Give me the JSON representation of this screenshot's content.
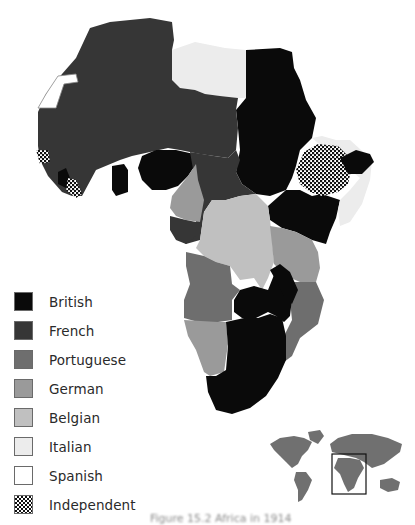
{
  "map": {
    "title": "Colonial Africa",
    "colors": {
      "British": "#0a0a0a",
      "French": "#363636",
      "Portuguese": "#6e6e6e",
      "German": "#9a9a9a",
      "Belgian": "#c0c0c0",
      "Italian": "#ececec",
      "Spanish": "#ffffff",
      "Independent": "pattern-checker"
    },
    "regions": [
      {
        "name": "French West & North Africa",
        "power": "French"
      },
      {
        "name": "Spanish Sahara",
        "power": "Spanish"
      },
      {
        "name": "Libya",
        "power": "Italian"
      },
      {
        "name": "Egypt & Sudan",
        "power": "British"
      },
      {
        "name": "Ethiopia",
        "power": "Independent"
      },
      {
        "name": "Liberia",
        "power": "Independent"
      },
      {
        "name": "Somaliland",
        "power": "British"
      },
      {
        "name": "Italian Somaliland",
        "power": "Italian"
      },
      {
        "name": "Nigeria",
        "power": "British"
      },
      {
        "name": "Gold Coast",
        "power": "British"
      },
      {
        "name": "Sierra Leone",
        "power": "British"
      },
      {
        "name": "Kamerun",
        "power": "German"
      },
      {
        "name": "French Equatorial Africa",
        "power": "French"
      },
      {
        "name": "Belgian Congo",
        "power": "Belgian"
      },
      {
        "name": "Kenya & Uganda",
        "power": "British"
      },
      {
        "name": "German East Africa",
        "power": "German"
      },
      {
        "name": "Angola",
        "power": "Portuguese"
      },
      {
        "name": "Mozambique",
        "power": "Portuguese"
      },
      {
        "name": "Rhodesia",
        "power": "British"
      },
      {
        "name": "German South West Africa",
        "power": "German"
      },
      {
        "name": "South Africa",
        "power": "British"
      }
    ]
  },
  "legend": {
    "items": [
      {
        "label": "British",
        "color": "#0a0a0a"
      },
      {
        "label": "French",
        "color": "#363636"
      },
      {
        "label": "Portuguese",
        "color": "#6e6e6e"
      },
      {
        "label": "German",
        "color": "#9a9a9a"
      },
      {
        "label": "Belgian",
        "color": "#c0c0c0"
      },
      {
        "label": "Italian",
        "color": "#ececec"
      },
      {
        "label": "Spanish",
        "color": "#ffffff"
      },
      {
        "label": "Independent",
        "color": "checker"
      }
    ]
  },
  "inset": {
    "label": "World locator map",
    "highlight": "Africa"
  },
  "caption": {
    "text": "Figure 15.2 Africa in 1914"
  }
}
